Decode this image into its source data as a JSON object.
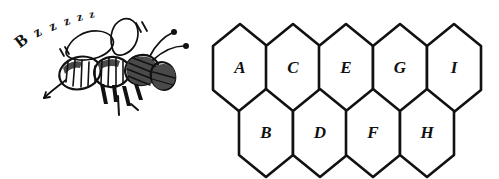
{
  "illustration": {
    "title": "Bee and labelled honeycomb diagram",
    "background_color": "#ffffff",
    "ink_color": "#111111"
  },
  "bee": {
    "name": "bee-drawing",
    "sound_text": "Bzzzzz",
    "sound_letters": [
      "B",
      "z",
      "z",
      "z",
      "z",
      "z"
    ],
    "parts": [
      "wings",
      "thorax",
      "abdomen",
      "head",
      "antennae",
      "legs",
      "stinger",
      "motion-lines"
    ]
  },
  "honeycomb": {
    "name": "honeycomb-diagram",
    "rows": 2,
    "top_row": {
      "count": 5,
      "cells": [
        {
          "label": "A"
        },
        {
          "label": "C"
        },
        {
          "label": "E"
        },
        {
          "label": "G"
        },
        {
          "label": "I"
        }
      ]
    },
    "bottom_row": {
      "count": 4,
      "cells": [
        {
          "label": "B"
        },
        {
          "label": "D"
        },
        {
          "label": "F"
        },
        {
          "label": "H"
        }
      ]
    }
  },
  "geometry": {
    "hex_width": 54,
    "hex_height": 88,
    "top_row_centers_x": [
      240,
      293,
      346,
      400,
      454
    ],
    "top_row_center_y": 68,
    "bottom_row_centers_x": [
      266,
      320,
      373,
      427
    ],
    "bottom_row_center_y": 133
  },
  "buzz_glyph_layout": [
    {
      "char": "B",
      "x": 22,
      "y": 42,
      "size": 17,
      "rotate": -38
    },
    {
      "char": "z",
      "x": 38,
      "y": 33,
      "size": 15,
      "rotate": -30
    },
    {
      "char": "z",
      "x": 53,
      "y": 27,
      "size": 14,
      "rotate": -24
    },
    {
      "char": "z",
      "x": 67,
      "y": 22,
      "size": 13,
      "rotate": -18
    },
    {
      "char": "z",
      "x": 80,
      "y": 18,
      "size": 12,
      "rotate": -14
    },
    {
      "char": "z",
      "x": 92,
      "y": 15,
      "size": 11,
      "rotate": -10
    }
  ]
}
